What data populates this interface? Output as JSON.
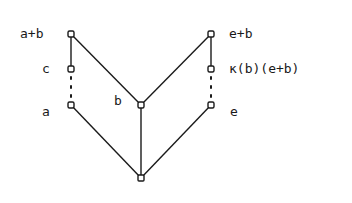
{
  "diagram": {
    "type": "lattice",
    "nodes": [
      {
        "id": "a_plus_b",
        "label": "a+b"
      },
      {
        "id": "c",
        "label": "c"
      },
      {
        "id": "a",
        "label": "a"
      },
      {
        "id": "b",
        "label": "b"
      },
      {
        "id": "e_plus_b",
        "label": "e+b"
      },
      {
        "id": "kappa",
        "label": "κ(b)(e+b)"
      },
      {
        "id": "e",
        "label": "e"
      },
      {
        "id": "bottom",
        "label": ""
      }
    ],
    "edges": [
      {
        "from": "a_plus_b",
        "to": "c",
        "style": "solid"
      },
      {
        "from": "c",
        "to": "a",
        "style": "dotted"
      },
      {
        "from": "a_plus_b",
        "to": "b",
        "style": "solid"
      },
      {
        "from": "e_plus_b",
        "to": "b",
        "style": "solid"
      },
      {
        "from": "e_plus_b",
        "to": "kappa",
        "style": "solid"
      },
      {
        "from": "kappa",
        "to": "e",
        "style": "dotted"
      },
      {
        "from": "a",
        "to": "bottom",
        "style": "solid"
      },
      {
        "from": "b",
        "to": "bottom",
        "style": "solid"
      },
      {
        "from": "e",
        "to": "bottom",
        "style": "solid"
      }
    ]
  }
}
